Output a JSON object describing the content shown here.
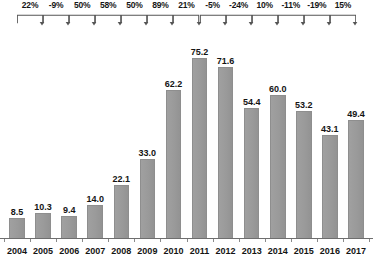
{
  "chart_data": {
    "type": "bar",
    "title": "",
    "subtitle": "",
    "xlabel": "",
    "ylabel": "",
    "grid": false,
    "legend": "none",
    "ylim": [
      0,
      80
    ],
    "categories": [
      "2004",
      "2005",
      "2006",
      "2007",
      "2008",
      "2009",
      "2010",
      "2011",
      "2012",
      "2013",
      "2014",
      "2015",
      "2016",
      "2017"
    ],
    "values": [
      8.5,
      10.3,
      9.4,
      14.0,
      22.1,
      33.0,
      62.2,
      75.2,
      71.6,
      54.4,
      60.0,
      53.2,
      43.1,
      49.4
    ],
    "value_labels": [
      "8.5",
      "10.3",
      "9.4",
      "14.0",
      "22.1",
      "33.0",
      "62.2",
      "75.2",
      "71.6",
      "54.4",
      "60.0",
      "53.2",
      "43.1",
      "49.4"
    ],
    "annotations": {
      "type": "year-over-year-growth-brackets",
      "labels": [
        "22%",
        "-9%",
        "50%",
        "58%",
        "50%",
        "89%",
        "21%",
        "-5%",
        "-24%",
        "10%",
        "-11%",
        "-19%",
        "15%"
      ],
      "spans": [
        [
          "2004",
          "2005"
        ],
        [
          "2005",
          "2006"
        ],
        [
          "2006",
          "2007"
        ],
        [
          "2007",
          "2008"
        ],
        [
          "2008",
          "2009"
        ],
        [
          "2009",
          "2010"
        ],
        [
          "2010",
          "2011"
        ],
        [
          "2011",
          "2012"
        ],
        [
          "2012",
          "2013"
        ],
        [
          "2013",
          "2014"
        ],
        [
          "2014",
          "2015"
        ],
        [
          "2015",
          "2016"
        ],
        [
          "2016",
          "2017"
        ]
      ]
    },
    "colors": {
      "bar_fill": "#9b9b9b",
      "bar_border": "#8e8e8e",
      "axis": "#6e6e6e",
      "text": "#141414",
      "bracket": "#555555",
      "background": "#ffffff"
    }
  }
}
